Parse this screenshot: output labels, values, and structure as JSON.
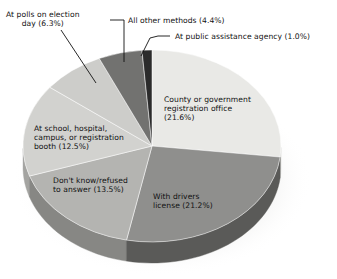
{
  "chart_data": {
    "type": "pie",
    "title": "",
    "subtitle": "",
    "xlabel": "",
    "ylabel": "",
    "legend_position": "none",
    "grid": false,
    "style": "3d-exploded-none",
    "units": "percent",
    "categories": [
      "County or government registration office",
      "With drivers license",
      "Don't know/refused to answer",
      "At school, hospital, campus, or registration booth",
      "At polls on election day",
      "All other methods",
      "At public assistance agency"
    ],
    "values": [
      21.6,
      21.2,
      13.5,
      12.5,
      6.3,
      4.4,
      1.0
    ],
    "slices": [
      {
        "name": "county-government-registration-office",
        "label": "County or government registration office (21.6%)",
        "label_text": "County or government\nregistration office\n(21.6%)",
        "value": 21.6,
        "color": "#e9e9e6",
        "side_color": "#c9c9c6",
        "label_placement": "inside",
        "label_left": 164,
        "label_top": 95
      },
      {
        "name": "with-drivers-license",
        "label": "With drivers license (21.2%)",
        "label_text": "With drivers\nlicense (21.2%)",
        "value": 21.2,
        "color": "#8f8f8d",
        "side_color": "#5a5a58",
        "label_placement": "inside",
        "label_left": 153,
        "label_top": 192
      },
      {
        "name": "dont-know-refused-to-answer",
        "label": "Don't know/refused to answer (13.5%)",
        "label_text": "Don't know/refused\nto answer (13.5%)",
        "value": 13.5,
        "color": "#b4b4b1",
        "side_color": "#878784",
        "label_placement": "inside",
        "label_left": 53,
        "label_top": 176
      },
      {
        "name": "at-school-hospital-campus-registration-booth",
        "label": "At school, hospital, campus, or registration booth (12.5%)",
        "label_text": "At school, hospital,\ncampus, or registration\nbooth (12.5%)",
        "value": 12.5,
        "color": "#d2d2cf",
        "side_color": "#a4a4a1",
        "label_placement": "inside",
        "label_left": 34,
        "label_top": 124
      },
      {
        "name": "at-polls-on-election-day",
        "label": "At polls on election day (6.3%)",
        "label_text": "At polls on election\nday (6.3%)",
        "value": 6.3,
        "color": "#cdcdca",
        "side_color": "#9c9c99",
        "label_placement": "outside",
        "label_left": 6,
        "label_top": 10,
        "leader": "M 61,30 L 96,83"
      },
      {
        "name": "all-other-methods",
        "label": "All other methods (4.4%)",
        "label_text": "All other methods (4.4%)",
        "value": 4.4,
        "color": "#727270",
        "side_color": "#4b4b49",
        "label_placement": "outside",
        "label_left": 128,
        "label_top": 16,
        "leader": "M 110,20 L 124,20 L 124,62"
      },
      {
        "name": "at-public-assistance-agency",
        "label": "At public assistance agency (1.0%)",
        "label_text": "At public assistance agency (1.0%)",
        "value": 1.0,
        "color": "#2b2b2b",
        "side_color": "#191919",
        "label_placement": "outside",
        "label_left": 175,
        "label_top": 32,
        "leader": "M 158,36 L 170,36 M 141,56 L 150,38 L 158,36"
      }
    ],
    "geometry": {
      "center_x": 152,
      "center_y": 146,
      "radius_x": 129,
      "radius_y": 96,
      "depth": 21,
      "start_angle_deg": -90,
      "direction": "clockwise"
    }
  }
}
